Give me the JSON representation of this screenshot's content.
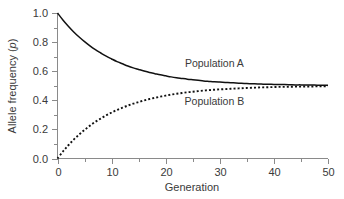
{
  "chart_data": {
    "type": "line",
    "title": "",
    "subtitle": "",
    "xlabel": "Generation",
    "ylabel": "Allele frequency (p)",
    "ylabel_plain": "Allele frequency (",
    "ylabel_italic": "p",
    "ylabel_close": ")",
    "xlim": [
      0,
      50
    ],
    "ylim": [
      0.0,
      1.0
    ],
    "grid": false,
    "legend_position": "inline-annotations",
    "x_ticks": [
      0,
      10,
      20,
      30,
      40,
      50
    ],
    "x_tick_labels": [
      "0",
      "10",
      "20",
      "30",
      "40",
      "50"
    ],
    "x_minor_ticks": [
      5,
      15,
      25,
      35,
      45
    ],
    "y_ticks": [
      0.0,
      0.2,
      0.4,
      0.6,
      0.8,
      1.0
    ],
    "y_tick_labels": [
      "0.0",
      "0.2",
      "0.4",
      "0.6",
      "0.8",
      "1.0"
    ],
    "y_minor_ticks": [
      0.1,
      0.3,
      0.5,
      0.7,
      0.9
    ],
    "x": [
      0,
      1,
      2,
      3,
      4,
      5,
      6,
      7,
      8,
      9,
      10,
      11,
      12,
      13,
      14,
      15,
      16,
      17,
      18,
      19,
      20,
      21,
      22,
      23,
      24,
      25,
      26,
      27,
      28,
      29,
      30,
      31,
      32,
      33,
      34,
      35,
      36,
      37,
      38,
      39,
      40,
      41,
      42,
      43,
      44,
      45,
      46,
      47,
      48,
      49,
      50
    ],
    "series": [
      {
        "name": "Population A",
        "style": "solid",
        "color": "#111111",
        "label_x": 29,
        "label_y": 0.655,
        "values": [
          1.0,
          0.952,
          0.909,
          0.87,
          0.835,
          0.803,
          0.774,
          0.748,
          0.725,
          0.703,
          0.684,
          0.666,
          0.651,
          0.636,
          0.623,
          0.612,
          0.601,
          0.591,
          0.583,
          0.575,
          0.568,
          0.561,
          0.555,
          0.55,
          0.545,
          0.541,
          0.537,
          0.533,
          0.53,
          0.527,
          0.525,
          0.523,
          0.521,
          0.519,
          0.517,
          0.515,
          0.514,
          0.512,
          0.511,
          0.51,
          0.509,
          0.508,
          0.508,
          0.507,
          0.506,
          0.506,
          0.505,
          0.505,
          0.504,
          0.504,
          0.503
        ]
      },
      {
        "name": "Population B",
        "style": "dotted",
        "color": "#111111",
        "label_x": 29,
        "label_y": 0.395,
        "values": [
          0.0,
          0.048,
          0.091,
          0.13,
          0.165,
          0.197,
          0.226,
          0.252,
          0.275,
          0.297,
          0.316,
          0.334,
          0.349,
          0.364,
          0.377,
          0.388,
          0.399,
          0.409,
          0.417,
          0.425,
          0.432,
          0.439,
          0.445,
          0.45,
          0.455,
          0.459,
          0.463,
          0.467,
          0.47,
          0.473,
          0.475,
          0.477,
          0.479,
          0.481,
          0.483,
          0.485,
          0.486,
          0.488,
          0.489,
          0.49,
          0.491,
          0.492,
          0.492,
          0.493,
          0.494,
          0.494,
          0.495,
          0.495,
          0.496,
          0.496,
          0.497
        ]
      }
    ],
    "annotations": [
      {
        "text": "Population A",
        "x": 29,
        "y": 0.655
      },
      {
        "text": "Population B",
        "x": 29,
        "y": 0.395
      }
    ],
    "converges_to": 0.5
  }
}
